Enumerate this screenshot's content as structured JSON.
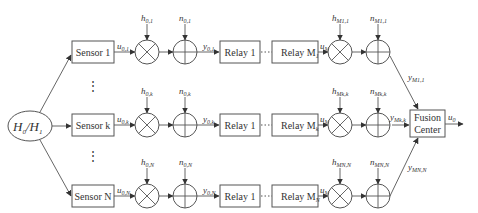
{
  "source": {
    "label_main": "H",
    "sub0": "0",
    "sep": "/",
    "label_alt": "H",
    "sub1": "1"
  },
  "rows": [
    {
      "id": "1",
      "sensor": "Sensor 1",
      "u_in": {
        "base": "u",
        "sub": "0,1"
      },
      "h": {
        "base": "h",
        "sub": "0,1"
      },
      "n": {
        "base": "n",
        "sub": "0,1"
      },
      "y": {
        "base": "y",
        "sub": "0,1"
      },
      "relay_first": "Relay 1",
      "relay_last": "Relay M",
      "relay_last_sub": "1",
      "u_out": {
        "base": "u",
        "sub": "M1,1"
      },
      "h_out": {
        "base": "h",
        "sub": "M1,1"
      },
      "n_out": {
        "base": "n",
        "sub": "M1,1"
      },
      "y_out": {
        "base": "y",
        "sub": "M1,1"
      }
    },
    {
      "id": "k",
      "sensor": "Sensor k",
      "u_in": {
        "base": "u",
        "sub": "0,k"
      },
      "h": {
        "base": "h",
        "sub": "0,k"
      },
      "n": {
        "base": "n",
        "sub": "0,k"
      },
      "y": {
        "base": "y",
        "sub": "0,k"
      },
      "relay_first": "Relay 1",
      "relay_last": "Relay M",
      "relay_last_sub": "k",
      "u_out": {
        "base": "u",
        "sub": "Mk,k"
      },
      "h_out": {
        "base": "h",
        "sub": "Mk,k"
      },
      "n_out": {
        "base": "n",
        "sub": "Mk,k"
      },
      "y_out": {
        "base": "y",
        "sub": "Mk,k"
      }
    },
    {
      "id": "N",
      "sensor": "Sensor N",
      "u_in": {
        "base": "u",
        "sub": "0,N"
      },
      "h": {
        "base": "h",
        "sub": "0,N"
      },
      "n": {
        "base": "n",
        "sub": "0,N"
      },
      "y": {
        "base": "y",
        "sub": "0,N"
      },
      "relay_first": "Relay 1",
      "relay_last": "Relay M",
      "relay_last_sub": "N",
      "u_out": {
        "base": "u",
        "sub": "MN,N"
      },
      "h_out": {
        "base": "h",
        "sub": "MN,N"
      },
      "n_out": {
        "base": "n",
        "sub": "MN,N"
      },
      "y_out": {
        "base": "y",
        "sub": "MN,N"
      }
    }
  ],
  "ellipsis": "⋮",
  "fusion": {
    "line1": "Fusion",
    "line2": "Center"
  },
  "output": {
    "base": "u",
    "sub": "0"
  }
}
